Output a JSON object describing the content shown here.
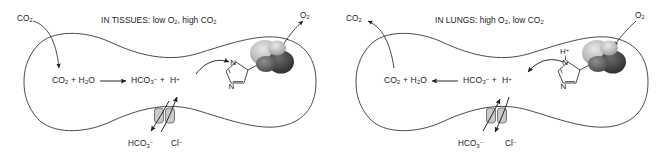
{
  "figure": {
    "name": "chloride-shift-bicarbonate-transport-diagram",
    "background_color": "#ffffff",
    "ink_color": "#1b1b1b"
  },
  "panels": [
    {
      "id": "tissues",
      "title": "IN TISSUES: low O2, high CO2",
      "title_parts": {
        "prefix": "IN TISSUES: low O",
        "sub1": "2",
        "middle": ", high CO",
        "sub2": "2"
      },
      "gas_in": {
        "label": "CO2",
        "formula_base": "CO",
        "formula_sub": "2",
        "direction": "into-cell",
        "position": "top-left"
      },
      "gas_out": {
        "label": "O2",
        "formula_base": "O",
        "formula_sub": "2",
        "direction": "out-of-cell",
        "position": "top-right"
      },
      "equation": {
        "left_base": "CO",
        "left_sub": "2",
        "plus1": "+",
        "water_base": "H",
        "water_sub": "2",
        "water_tail": "O",
        "arrow": "right",
        "bicarb_base": "HCO",
        "bicarb_sub": "3",
        "bicarb_sup": "−",
        "plus2": "+",
        "proton_base": "H",
        "proton_sup": "+"
      },
      "proton_flow": {
        "direction": "right",
        "description": "H+ binds histidine on hemoglobin"
      },
      "histidine": {
        "ring_atoms": [
          "N",
          "N"
        ],
        "protonated": false,
        "proton_label": ""
      },
      "transporter": {
        "name": "band-3-anion-exchanger",
        "out_label_base": "HCO",
        "out_label_sub": "3",
        "out_label_sup": "−",
        "out_direction": "down-out",
        "in_label_base": "Cl",
        "in_label_sup": "−",
        "in_direction": "up-in"
      }
    },
    {
      "id": "lungs",
      "title": "IN LUNGS: high O2, low CO2",
      "title_parts": {
        "prefix": "IN LUNGS: high O",
        "sub1": "2",
        "middle": ", low CO",
        "sub2": "2"
      },
      "gas_in": {
        "label": "O2",
        "formula_base": "O",
        "formula_sub": "2",
        "direction": "into-cell",
        "position": "top-right"
      },
      "gas_out": {
        "label": "CO2",
        "formula_base": "CO",
        "formula_sub": "2",
        "direction": "out-of-cell",
        "position": "top-left"
      },
      "equation": {
        "left_base": "CO",
        "left_sub": "2",
        "plus1": "+",
        "water_base": "H",
        "water_sub": "2",
        "water_tail": "O",
        "arrow": "left",
        "bicarb_base": "HCO",
        "bicarb_sub": "3",
        "bicarb_sup": "−",
        "plus2": "+",
        "proton_base": "H",
        "proton_sup": "+"
      },
      "proton_flow": {
        "direction": "left",
        "description": "H+ released from histidine on hemoglobin"
      },
      "histidine": {
        "ring_atoms": [
          "N",
          "N"
        ],
        "protonated": true,
        "proton_label_base": "H",
        "proton_label_sup": "+"
      },
      "transporter": {
        "name": "band-3-anion-exchanger",
        "out_label_base": "HCO",
        "out_label_sub": "3",
        "out_label_sup": "−",
        "out_direction": "up-in",
        "in_label_base": "Cl",
        "in_label_sup": "−",
        "in_direction": "down-out"
      }
    }
  ]
}
